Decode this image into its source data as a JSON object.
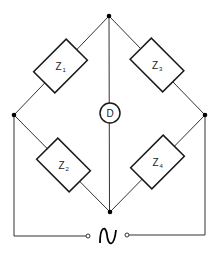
{
  "diagram": {
    "type": "Wheatstone / impedance bridge circuit",
    "components": [
      {
        "id": "Z1",
        "label": "Z",
        "subscript": "1",
        "position": "upper-left arm"
      },
      {
        "id": "Z2",
        "label": "Z",
        "subscript": "2",
        "position": "lower-left arm"
      },
      {
        "id": "Z3",
        "label": "Z",
        "subscript": "3",
        "position": "upper-right arm"
      },
      {
        "id": "Z4",
        "label": "Z",
        "subscript": "4",
        "position": "lower-right arm"
      }
    ],
    "detector": {
      "label": "D",
      "position": "center, between top and bottom nodes"
    },
    "source": {
      "symbol": "~",
      "type": "AC source",
      "position": "bottom, between terminals"
    },
    "nodes": [
      "top",
      "left",
      "right",
      "bottom"
    ],
    "colors": {
      "line": "#333333",
      "background": "#ffffff"
    }
  }
}
